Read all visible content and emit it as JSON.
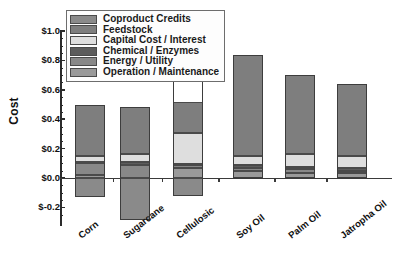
{
  "chart_data": {
    "type": "bar",
    "subtype": "stacked-bar-with-negative",
    "title": "",
    "xlabel": "",
    "ylabel": "Cost",
    "ylim": [
      -0.3,
      1.05
    ],
    "yticks": [
      "$-0.2",
      "$0.0",
      "$0.2",
      "$0.4",
      "$0.6",
      "$0.8",
      "$1.0"
    ],
    "ytick_values": [
      -0.2,
      0.0,
      0.2,
      0.4,
      0.6,
      0.8,
      1.0
    ],
    "minor_ticks": true,
    "grid": false,
    "legend_position": "top-left-inside",
    "categories": [
      "Corn",
      "Sugarcane",
      "Cellulosic",
      "Soy Oil",
      "Palm Oil",
      "Jatropha Oil"
    ],
    "series": [
      {
        "name": "Coproduct Credits",
        "color": "#8a8a8a",
        "values": [
          -0.13,
          -0.29,
          -0.125,
          0.0,
          0.0,
          0.0
        ]
      },
      {
        "name": "Feedstock",
        "color": "#7e7e7e",
        "values": [
          0.35,
          0.32,
          0.215,
          0.685,
          0.535,
          0.49
        ]
      },
      {
        "name": "Capital Cost / Interest",
        "color": "#dedede",
        "values": [
          0.04,
          0.055,
          0.21,
          0.06,
          0.09,
          0.08
        ]
      },
      {
        "name": "Chemical / Enzymes",
        "color": "#5c5c5c",
        "values": [
          0.01,
          0.015,
          0.01,
          0.02,
          0.015,
          0.02
        ]
      },
      {
        "name": "Energy / Utility",
        "color": "#888888",
        "values": [
          0.08,
          0.09,
          0.015,
          0.02,
          0.025,
          0.02
        ]
      },
      {
        "name": "Operation / Maintenance",
        "color": "#9a9a9a",
        "values": [
          0.02,
          0.0,
          0.07,
          0.05,
          0.035,
          0.03
        ]
      }
    ],
    "totals_positive": [
      0.5,
      0.48,
      0.52,
      0.835,
      0.7,
      0.64
    ],
    "bar_tops": [
      0.5,
      0.485,
      0.69,
      0.835,
      0.7,
      0.64
    ],
    "bar_bottoms": [
      -0.13,
      -0.29,
      -0.125,
      0.0,
      0.0,
      0.0
    ]
  },
  "legend": {
    "entries": [
      {
        "label": "Coproduct Credits",
        "color": "#8a8a8a"
      },
      {
        "label": "Feedstock",
        "color": "#7e7e7e"
      },
      {
        "label": "Capital Cost / Interest",
        "color": "#dedede"
      },
      {
        "label": "Chemical / Enzymes",
        "color": "#5c5c5c"
      },
      {
        "label": "Energy / Utility",
        "color": "#888888"
      },
      {
        "label": "Operation / Maintenance",
        "color": "#9a9a9a"
      }
    ]
  }
}
